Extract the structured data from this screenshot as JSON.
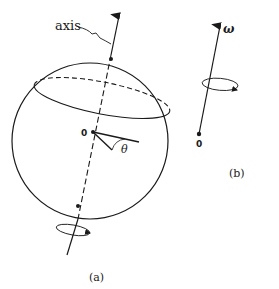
{
  "figure": {
    "panel_a": {
      "caption": "(a)",
      "axis_label": "axis",
      "origin_label": "0",
      "angle_label": "θ"
    },
    "panel_b": {
      "caption": "(b)",
      "vector_label": "ω",
      "origin_label": "0"
    },
    "colors": {
      "ink": "#1a1a1a",
      "background": "#ffffff"
    }
  }
}
